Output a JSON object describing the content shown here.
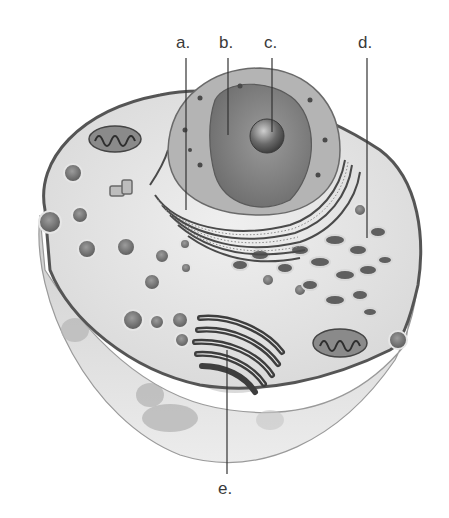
{
  "diagram": {
    "style": "grayscale illustration",
    "labels": [
      {
        "id": "a",
        "text": "a.",
        "x": 176,
        "y": 34,
        "line_top": 58,
        "line_bottom": 210
      },
      {
        "id": "b",
        "text": "b.",
        "x": 221,
        "y": 34,
        "line_top": 58,
        "line_bottom": 135
      },
      {
        "id": "c",
        "text": "c.",
        "x": 264,
        "y": 34,
        "line_top": 58,
        "line_bottom": 132
      },
      {
        "id": "d",
        "text": "d.",
        "x": 358,
        "y": 34,
        "line_top": 58,
        "line_bottom": 238
      },
      {
        "id": "e",
        "text": "e.",
        "x": 218,
        "y": 480,
        "line_top": 350,
        "line_bottom": 474
      }
    ],
    "structures": [
      "plasma-membrane",
      "nucleus",
      "nucleolus",
      "nuclear-envelope",
      "rough-endoplasmic-reticulum",
      "golgi-apparatus",
      "mitochondrion",
      "vesicles",
      "centrioles"
    ]
  }
}
